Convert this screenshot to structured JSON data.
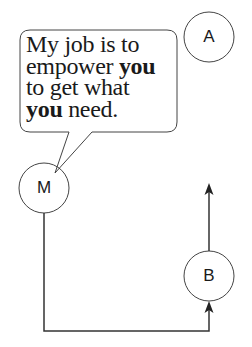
{
  "diagram": {
    "speech_bubble": {
      "speaker": "M",
      "lines": [
        [
          {
            "text": "My job is to",
            "bold": false
          }
        ],
        [
          {
            "text": "empower ",
            "bold": false
          },
          {
            "text": "you",
            "bold": true
          }
        ],
        [
          {
            "text": "to get what",
            "bold": false
          }
        ],
        [
          {
            "text": "you",
            "bold": true
          },
          {
            "text": " need.",
            "bold": false
          }
        ]
      ]
    },
    "nodes": {
      "a": {
        "label": "A"
      },
      "m": {
        "label": "M"
      },
      "b": {
        "label": "B"
      }
    },
    "edges": [
      {
        "from": "M",
        "to": "B",
        "route": "down, right, up",
        "arrow": "into B"
      },
      {
        "from": "B",
        "to": "up",
        "arrow": "pointing up"
      }
    ],
    "colors": {
      "stroke": "#333333",
      "background": "#ffffff"
    }
  }
}
